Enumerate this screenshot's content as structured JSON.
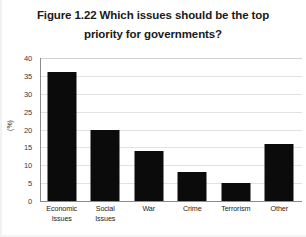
{
  "chart_data": {
    "type": "bar",
    "title": "Figure 1.22 Which issues should be the top priority for governments?",
    "title_lines": [
      "Figure 1.22 Which issues should be the top",
      "priority for governments?"
    ],
    "categories": [
      "Economic Issues",
      "Social Issues",
      "War",
      "Crime",
      "Terrorism",
      "Other"
    ],
    "category_lines": [
      [
        "Economic",
        "Issues"
      ],
      [
        "Social",
        "Issues"
      ],
      [
        "War"
      ],
      [
        "Crime"
      ],
      [
        "Terrorism"
      ],
      [
        "Other"
      ]
    ],
    "values": [
      36,
      20,
      14,
      8,
      5,
      16
    ],
    "xlabel": "",
    "ylabel": "(%)",
    "ylim": [
      0,
      40
    ],
    "ytick_step": 5,
    "yticks": [
      40,
      35,
      30,
      25,
      20,
      15,
      10,
      5,
      0
    ],
    "ytick_labels": [
      "40",
      "35",
      "30",
      "25",
      "20",
      "15",
      "10",
      "5",
      "0"
    ],
    "grid": true,
    "grid_axis": "y",
    "legend": false,
    "bar_color": "#0b0b0b",
    "gridline_color": "#e2e2e2",
    "axis_color": "#8c8c8c",
    "background_color": "#ffffff"
  }
}
